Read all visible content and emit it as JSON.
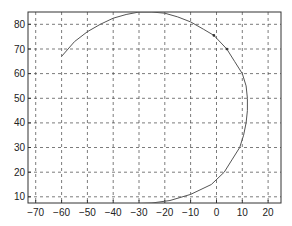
{
  "chart_data": {
    "type": "line",
    "title": "",
    "xlabel": "",
    "ylabel": "",
    "xlim": [
      -73,
      25
    ],
    "ylim": [
      7.5,
      85
    ],
    "grid": true,
    "grid_style": "dashed",
    "legend": null,
    "x_ticks": [
      -70,
      -60,
      -50,
      -40,
      -30,
      -20,
      -10,
      0,
      10,
      20
    ],
    "y_ticks": [
      10,
      20,
      30,
      40,
      50,
      60,
      70,
      80
    ],
    "x_tick_labels": [
      "−70",
      "−60",
      "−50",
      "−40",
      "−30",
      "−20",
      "−10",
      "0",
      "10",
      "20"
    ],
    "y_tick_labels": [
      "10",
      "20",
      "30",
      "40",
      "50",
      "60",
      "70",
      "80"
    ],
    "series": [
      {
        "name": "trajectory",
        "color": "#555555",
        "x": [
          -60,
          -55,
          -50,
          -45,
          -40,
          -35,
          -30,
          -25,
          -20,
          -15,
          -10,
          -5,
          -1,
          4,
          7,
          10,
          11.5,
          12,
          12,
          11.5,
          10.5,
          9,
          6,
          3,
          -2,
          -10,
          -18,
          -25,
          -30
        ],
        "y": [
          67,
          73,
          77,
          80,
          82.5,
          84,
          85,
          85,
          84.5,
          83,
          81,
          78,
          75.5,
          70,
          65,
          60,
          55,
          50,
          45,
          40,
          35,
          30,
          25,
          20,
          15,
          11,
          8.5,
          7.5,
          7.3
        ]
      }
    ],
    "markers": [
      {
        "x": -1,
        "y": 75.5
      },
      {
        "x": 4,
        "y": 70
      }
    ]
  },
  "colors": {
    "axis": "#333333",
    "grid": "#444444",
    "line": "#555555",
    "background": "#ffffff"
  }
}
